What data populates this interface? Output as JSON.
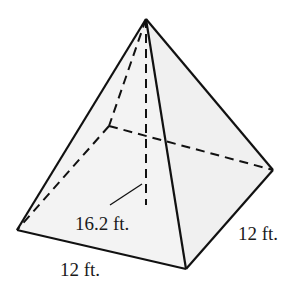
{
  "diagram": {
    "type": "square-pyramid",
    "colors": {
      "background": "#ffffff",
      "face_fill": "#f2f2f2",
      "stroke": "#111111",
      "text": "#1a1a1a"
    },
    "labels": {
      "height": "16.2 ft.",
      "base_front_edge": "12 ft.",
      "base_right_edge": "12 ft."
    },
    "vertices": {
      "apex": [
        146,
        19
      ],
      "base_left": [
        17,
        230
      ],
      "base_front": [
        186,
        269
      ],
      "base_right": [
        273,
        170
      ],
      "base_back_hidden": [
        109,
        126
      ],
      "height_foot": [
        146,
        205
      ]
    }
  }
}
